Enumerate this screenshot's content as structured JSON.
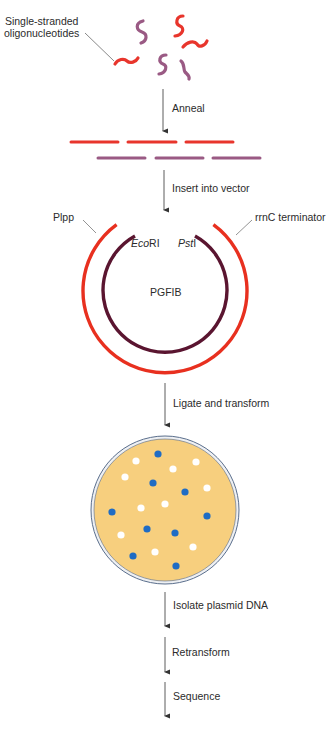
{
  "labels": {
    "oligos": [
      "Single-stranded",
      "oligonucleotides"
    ],
    "step_anneal": "Anneal",
    "step_insert": "Insert into vector",
    "promoter": "Plpp",
    "terminator": "rrnC terminator",
    "site_left_italic": "Eco",
    "site_left_roman": "RI",
    "site_right_italic": "Pst",
    "site_right_roman": "I",
    "plasmid_name": "PGFIB",
    "step_ligate": "Ligate and transform",
    "step_isolate": "Isolate plasmid DNA",
    "step_retransform": "Retransform",
    "step_sequence": "Sequence"
  },
  "colors": {
    "red_strand": "#e8352c",
    "purple_strand": "#9a5a84",
    "vector_outer": "#e8301f",
    "insert_inner": "#5a1530",
    "agar": "#f7cf7e",
    "dish_rim": "#5a6e8c",
    "blue_colony": "#1f6cc4",
    "white_colony": "#ffffff",
    "arrow": "#333333"
  },
  "colonies": {
    "blue": [
      [
        158,
        454
      ],
      [
        153,
        483
      ],
      [
        185,
        492
      ],
      [
        112,
        512
      ],
      [
        207,
        516
      ],
      [
        147,
        529
      ],
      [
        175,
        533
      ],
      [
        133,
        556
      ],
      [
        176,
        566
      ]
    ],
    "white": [
      [
        136,
        461
      ],
      [
        196,
        462
      ],
      [
        173,
        469
      ],
      [
        125,
        477
      ],
      [
        207,
        488
      ],
      [
        141,
        508
      ],
      [
        165,
        504
      ],
      [
        121,
        535
      ],
      [
        155,
        552
      ],
      [
        193,
        547
      ]
    ]
  }
}
